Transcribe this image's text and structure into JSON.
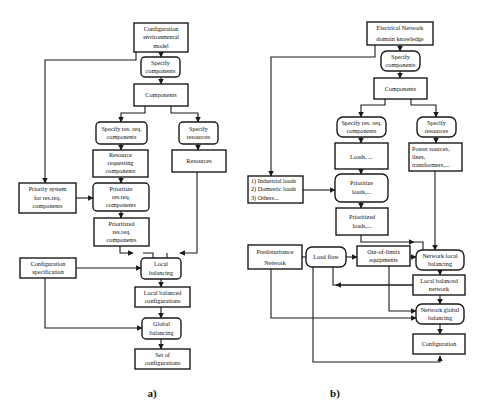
{
  "diagram_a": {
    "caption": "a)",
    "nodes": {
      "config_env_model": [
        "Configuration",
        "environmental",
        "model"
      ],
      "specify_components": [
        "Specify",
        "components"
      ],
      "components": [
        "Components"
      ],
      "specify_resreq": [
        "Specify res. req.",
        "components"
      ],
      "specify_resources": [
        "Specify",
        "resources"
      ],
      "resource_requesting": [
        "Resource",
        "requesting",
        "components"
      ],
      "resources": [
        "Resources"
      ],
      "priority_system": [
        "Priority system",
        "for res.req.",
        "components"
      ],
      "prioritize_resreq": [
        "Prioritize",
        "res.req.",
        "components"
      ],
      "prioritized_resreq": [
        "Prioritized",
        "res.req.",
        "components"
      ],
      "config_spec": [
        "Configuration",
        "specification"
      ],
      "local_balancing": [
        "Local",
        "balancing"
      ],
      "local_balanced_configs": [
        "Local balanced",
        "configurations"
      ],
      "global_balancing": [
        "Global",
        "balancing"
      ],
      "set_of_configs": [
        "Set of",
        "configurations"
      ]
    }
  },
  "diagram_b": {
    "caption": "b)",
    "nodes": {
      "electrical_network": [
        "Electrical Network",
        "domain knowledge"
      ],
      "specify_components": [
        "Specify",
        "components"
      ],
      "components": [
        "Components"
      ],
      "specify_resreq": [
        "Specify res. req.",
        "components"
      ],
      "specify_resources": [
        "Specify",
        "resources"
      ],
      "loads": [
        "Loads, ..."
      ],
      "power_sources": [
        "Power sources,",
        "lines,",
        "transformers,..."
      ],
      "load_types": [
        "1) Industrial loads",
        "2) Domestic loads",
        "3) Others..."
      ],
      "prioritize_loads": [
        "Prioritize",
        "loads,..."
      ],
      "prioritized_loads": [
        "Prioritized",
        "loads,..."
      ],
      "predisturbance": [
        "Predisturbance",
        "Network"
      ],
      "load_flow": [
        "Load flow"
      ],
      "out_of_limits": [
        "Out-of-limits",
        "equipments"
      ],
      "network_local": [
        "Network local",
        "balancing"
      ],
      "local_balanced_network": [
        "Local balanced",
        "network"
      ],
      "network_global": [
        "Network global",
        "balancing"
      ],
      "configuration": [
        "Configuration"
      ]
    }
  }
}
